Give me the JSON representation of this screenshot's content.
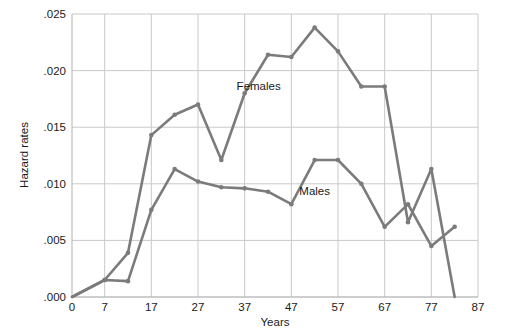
{
  "chart_data": {
    "type": "line",
    "title": "",
    "xlabel": "Years",
    "ylabel": "Hazard rates",
    "xlim": [
      0,
      87
    ],
    "ylim": [
      0.0,
      0.025
    ],
    "grid": true,
    "legend_position": "inline-annotations",
    "xticks": [
      "0",
      "7",
      "17",
      "27",
      "37",
      "47",
      "57",
      "67",
      "77",
      "87"
    ],
    "xtick_values": [
      0,
      7,
      17,
      27,
      37,
      47,
      57,
      67,
      77,
      87
    ],
    "yticks": [
      ".000",
      ".005",
      ".010",
      ".015",
      ".020",
      ".025"
    ],
    "ytick_values": [
      0.0,
      0.005,
      0.01,
      0.015,
      0.02,
      0.025
    ],
    "series": [
      {
        "name": "Females",
        "color": "#7b7b7b",
        "x": [
          0,
          7,
          12,
          17,
          22,
          27,
          32,
          37,
          42,
          47,
          52,
          57,
          62,
          67,
          72,
          77,
          82
        ],
        "values": [
          0.0,
          0.0015,
          0.0039,
          0.0143,
          0.0161,
          0.017,
          0.0121,
          0.018,
          0.0214,
          0.0212,
          0.0238,
          0.0217,
          0.0186,
          0.0186,
          0.0066,
          0.0113,
          0.0
        ]
      },
      {
        "name": "Males",
        "color": "#7b7b7b",
        "x": [
          0,
          7,
          12,
          17,
          22,
          27,
          32,
          37,
          42,
          47,
          52,
          57,
          62,
          67,
          72,
          77,
          82
        ],
        "values": [
          0.0,
          0.0015,
          0.0014,
          0.0077,
          0.0113,
          0.0102,
          0.0097,
          0.0096,
          0.0093,
          0.0082,
          0.0121,
          0.0121,
          0.01,
          0.0062,
          0.0082,
          0.0045,
          0.0062
        ]
      }
    ],
    "annotations": [
      {
        "text": "Females",
        "x": 40,
        "y": 0.0183
      },
      {
        "text": "Males",
        "x": 52,
        "y": 0.009
      }
    ]
  }
}
